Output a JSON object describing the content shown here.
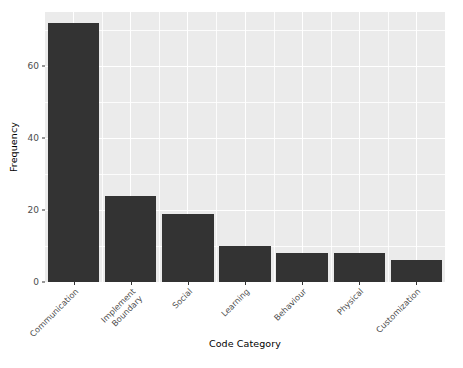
{
  "chart_data": {
    "type": "bar",
    "title": "",
    "xlabel": "Code Category",
    "ylabel": "Frequency",
    "categories": [
      "Communication",
      "Implement\nBoundary",
      "Social",
      "Learning",
      "Behaviour",
      "Physical",
      "Customization"
    ],
    "values": [
      72,
      24,
      19,
      10,
      8,
      8,
      6
    ],
    "ylim": [
      0,
      75
    ],
    "y_ticks": [
      0,
      20,
      40,
      60
    ],
    "y_tick_labels": [
      "0",
      "20",
      "40",
      "60"
    ],
    "grid": true,
    "legend": "none",
    "bar_color": "#333333",
    "panel_color": "#ebebeb",
    "grid_color": "#ffffff",
    "background_color": "#ffffff",
    "axis_text_color": "#4d4d4d",
    "axis_title_color": "#000000"
  },
  "axes": {
    "y_title": "Frequency",
    "x_title": "Code Category"
  }
}
